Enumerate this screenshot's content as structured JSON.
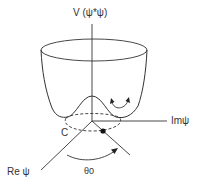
{
  "diagram": {
    "type": "mexican-hat-potential",
    "labels": {
      "v_axis": "V (ψ*ψ)",
      "im_axis": "Imψ",
      "re_axis": "Re ψ",
      "circle": "C",
      "angle": "θ0"
    },
    "colors": {
      "line": "#333333",
      "background": "#ffffff"
    }
  }
}
